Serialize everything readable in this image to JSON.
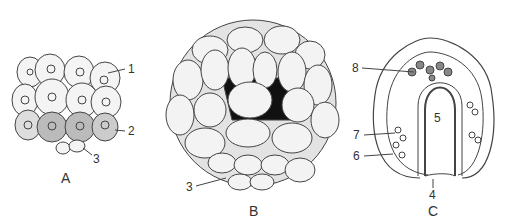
{
  "figures": [
    {
      "caption": "A",
      "labels": [
        "1",
        "2",
        "3"
      ]
    },
    {
      "caption": "B",
      "labels": [
        "3"
      ]
    },
    {
      "caption": "C",
      "labels": [
        "8",
        "5",
        "7",
        "6",
        "4"
      ]
    }
  ],
  "colors": {
    "ink": "#333333",
    "shade": "#bdbdbd",
    "dark": "#111111"
  }
}
